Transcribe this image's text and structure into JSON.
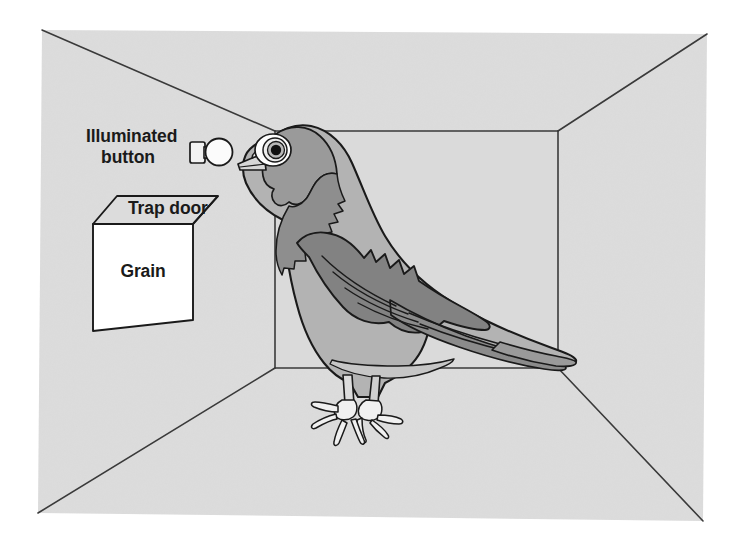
{
  "figure": {
    "name": "operant-conditioning-chamber",
    "labels": {
      "illuminated_button_line1": "Illuminated",
      "illuminated_button_line2": "button",
      "trap_door": "Trap door",
      "grain": "Grain"
    }
  },
  "colors": {
    "page_background": "#ffffff",
    "chamber_wall": "#dcdcdc",
    "chamber_floor": "#dcdcdc",
    "outline": "#1a1a1a",
    "line_thin": "#3a3a3a",
    "bird_light": "#b3b3b3",
    "bird_mid": "#a0a0a0",
    "bird_dark": "#808080",
    "bird_darkest": "#6e6e6e",
    "bird_white": "#f2f2f2",
    "eye_pupil": "#111111",
    "eye_iris": "#4a4a4a",
    "eye_ring": "#ffffff",
    "hopper_face": "#ffffff",
    "button_body": "#f5f5f5",
    "label_text": "#1a1a1a"
  },
  "geometry": {
    "chamber": {
      "outer_top_left": [
        42,
        30
      ],
      "outer_top_right": [
        707,
        34
      ],
      "outer_bottom_right": [
        703,
        521
      ],
      "outer_bottom_left": [
        38,
        513
      ],
      "inner_top_left": [
        275,
        131
      ],
      "inner_top_right": [
        558,
        131
      ],
      "inner_bottom_right": [
        558,
        368
      ],
      "inner_bottom_left": [
        275,
        368
      ]
    },
    "hopper": {
      "face_top_left": [
        93,
        224
      ],
      "face_top_right": [
        193,
        224
      ],
      "face_bottom_right": [
        193,
        320
      ],
      "face_bottom_left": [
        93,
        331
      ],
      "lid_back_left": [
        117,
        196
      ],
      "lid_back_right": [
        218,
        196
      ]
    },
    "button": {
      "center": [
        216,
        152
      ],
      "radius": 13,
      "mount_rect": [
        191,
        141,
        18,
        22
      ]
    }
  },
  "annotations": {
    "button_label_position": [
      90,
      132
    ],
    "trap_door_label_position": [
      128,
      209
    ],
    "grain_label_position": [
      115,
      271
    ]
  }
}
